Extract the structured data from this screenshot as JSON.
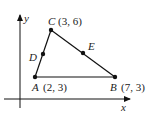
{
  "diagram": {
    "type": "coordinate-geometry-triangle",
    "axes": {
      "x_label": "x",
      "y_label": "y"
    },
    "points": {
      "A": {
        "name": "A",
        "coords": "(2, 3)"
      },
      "B": {
        "name": "B",
        "coords": "(7, 3)"
      },
      "C": {
        "name": "C",
        "coords": "(3, 6)"
      },
      "D": {
        "name": "D"
      },
      "E": {
        "name": "E"
      }
    },
    "segments": [
      "AB",
      "BC",
      "CA"
    ],
    "colors": {
      "line": "#111111",
      "label": "#222222",
      "background": "#ffffff"
    }
  }
}
